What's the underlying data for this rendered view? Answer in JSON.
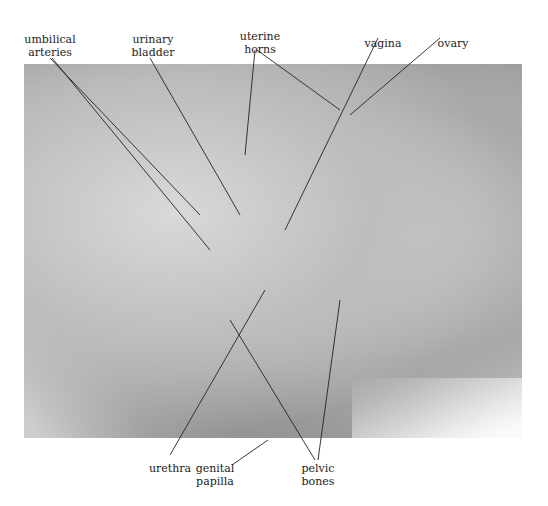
{
  "figure": {
    "labels": {
      "umbilical_arteries": [
        "umbilical",
        "arteries"
      ],
      "urinary_bladder": [
        "urinary",
        "bladder"
      ],
      "uterine_horns": [
        "uterine",
        "horns"
      ],
      "vagina": "vagina",
      "ovary": "ovary",
      "urethra": "urethra",
      "genital_papilla": [
        "genital",
        "papilla"
      ],
      "pelvic_bones": [
        "pelvic",
        "bones"
      ]
    }
  }
}
